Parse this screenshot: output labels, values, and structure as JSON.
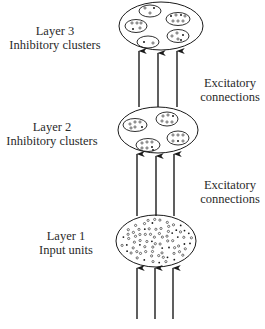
{
  "diagram": {
    "layers": [
      {
        "id": "layer3",
        "name": "Layer 3",
        "description": "Inhibitory clusters",
        "type": "clusters",
        "cluster_count": 5
      },
      {
        "id": "layer2",
        "name": "Layer 2",
        "description": "Inhibitory clusters",
        "type": "clusters",
        "cluster_count": 4
      },
      {
        "id": "layer1",
        "name": "Layer 1",
        "description": "Input units",
        "type": "units"
      }
    ],
    "connections": [
      {
        "from": "layer2",
        "to": "layer3",
        "label_line1": "Excitatory",
        "label_line2": "connections",
        "arrow_count": 3
      },
      {
        "from": "layer1",
        "to": "layer2",
        "label_line1": "Excitatory",
        "label_line2": "connections",
        "arrow_count": 3
      },
      {
        "from": "input",
        "to": "layer1",
        "arrow_count": 3
      }
    ],
    "colors": {
      "ink": "#1a1a1a",
      "background": "#ffffff"
    }
  }
}
